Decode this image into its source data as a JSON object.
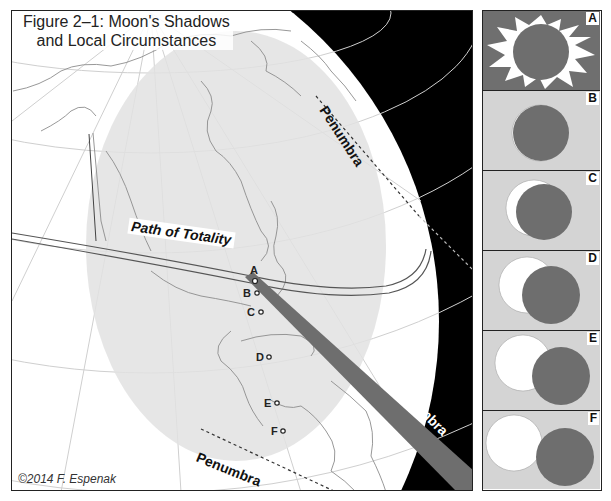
{
  "figure": {
    "title_line1": "Figure 2–1: Moon's Shadows",
    "title_line2": "and Local Circumstances",
    "copyright": "©2014 F. Espenak"
  },
  "map": {
    "labels": {
      "path_of_totality": "Path of Totality",
      "penumbra_top": "Penumbra",
      "penumbra_bottom": "Penumbra",
      "umbra": "Umbra"
    },
    "locations": [
      {
        "id": "A",
        "label": "A",
        "x": 244,
        "y": 272
      },
      {
        "id": "B",
        "label": "B",
        "x": 246,
        "y": 283
      },
      {
        "id": "C",
        "label": "C",
        "x": 249,
        "y": 302
      },
      {
        "id": "D",
        "label": "D",
        "x": 257,
        "y": 345
      },
      {
        "id": "E",
        "label": "E",
        "x": 265,
        "y": 392
      },
      {
        "id": "F",
        "label": "F",
        "x": 271,
        "y": 420
      }
    ],
    "colors": {
      "space": "#000000",
      "globe": "#ffffff",
      "penumbra_shade": "#e6e6e6",
      "umbra": "#6e6e6e",
      "coastline": "#999999"
    }
  },
  "panels": [
    {
      "letter": "A",
      "description": "Total eclipse - corona visible"
    },
    {
      "letter": "B",
      "description": "Near-total partial eclipse"
    },
    {
      "letter": "C",
      "description": "Partial eclipse"
    },
    {
      "letter": "D",
      "description": "Partial eclipse"
    },
    {
      "letter": "E",
      "description": "Partial eclipse"
    },
    {
      "letter": "F",
      "description": "Small partial eclipse"
    }
  ],
  "panel_colors": {
    "sky_total": "#6f6f6f",
    "sky_partial": "#d4d4d4",
    "moon": "#6e6e6e",
    "sun": "#ffffff"
  }
}
